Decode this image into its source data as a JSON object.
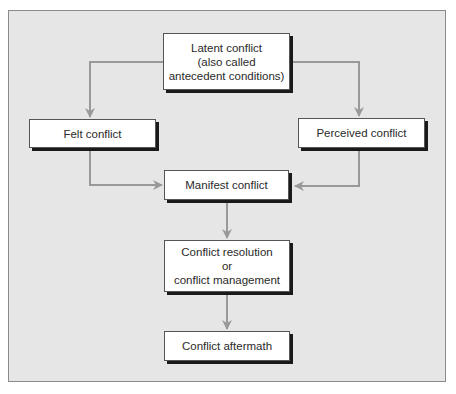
{
  "diagram": {
    "type": "flowchart",
    "colors": {
      "background": "#e6e6e6",
      "box_fill": "#ffffff",
      "box_border": "#555555",
      "box_shadow": "#1a1a1a",
      "arrow": "#999999",
      "text": "#2a2a2a"
    },
    "nodes": {
      "latent": {
        "lines": [
          "Latent conflict",
          "(also called",
          "antecedent conditions)"
        ]
      },
      "felt": {
        "lines": [
          "Felt conflict"
        ]
      },
      "perceived": {
        "lines": [
          "Perceived conflict"
        ]
      },
      "manifest": {
        "lines": [
          "Manifest conflict"
        ]
      },
      "resolution": {
        "lines": [
          "Conflict resolution",
          "or",
          "conflict management"
        ]
      },
      "aftermath": {
        "lines": [
          "Conflict aftermath"
        ]
      }
    },
    "edges": [
      {
        "from": "latent",
        "to": "felt"
      },
      {
        "from": "latent",
        "to": "perceived"
      },
      {
        "from": "felt",
        "to": "manifest"
      },
      {
        "from": "perceived",
        "to": "manifest"
      },
      {
        "from": "manifest",
        "to": "resolution"
      },
      {
        "from": "resolution",
        "to": "aftermath"
      }
    ]
  }
}
